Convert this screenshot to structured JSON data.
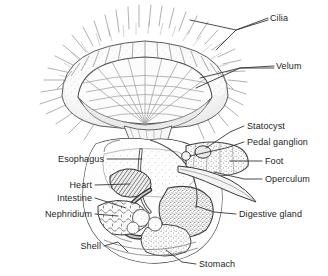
{
  "figure": {
    "kind": "biological-diagram",
    "background_color": "#ffffff",
    "ink_color": "#333333",
    "label_color": "#1d1d1d"
  },
  "labels": {
    "cilia": "Cilia",
    "velum": "Velum",
    "statocyst": "Statocyst",
    "pedal_ganglion": "Pedal ganglion",
    "foot": "Foot",
    "operculum": "Operculum",
    "digestive_gland": "Digestive gland",
    "stomach": "Stomach",
    "esophagus": "Esophagus",
    "heart": "Heart",
    "intestine": "Intestine",
    "nephridium": "Nephridium",
    "shell": "Shell"
  },
  "label_positions": {
    "cilia": {
      "x": 270,
      "y": 14,
      "side": "right"
    },
    "velum": {
      "x": 276,
      "y": 63,
      "side": "right"
    },
    "statocyst": {
      "x": 247,
      "y": 124,
      "side": "right"
    },
    "pedal_ganglion": {
      "x": 247,
      "y": 140,
      "side": "right"
    },
    "foot": {
      "x": 264,
      "y": 159,
      "side": "right"
    },
    "operculum": {
      "x": 264,
      "y": 177,
      "side": "right"
    },
    "digestive_gland": {
      "x": 238,
      "y": 212,
      "side": "right"
    },
    "stomach": {
      "x": 198,
      "y": 262,
      "side": "right"
    },
    "esophagus": {
      "x": 71,
      "y": 157,
      "side": "left"
    },
    "heart": {
      "x": 71,
      "y": 183,
      "side": "left"
    },
    "intestine": {
      "x": 71,
      "y": 196,
      "side": "left"
    },
    "nephridium": {
      "x": 71,
      "y": 212,
      "side": "left"
    },
    "shell": {
      "x": 78,
      "y": 244,
      "side": "left"
    }
  },
  "leader_lines": {
    "cilia": "forked, two tips on the ciliary fringe",
    "velum": "forked, two tips on the velar rim",
    "statocyst": "single diagonal to small oval body",
    "pedal_ganglion": "single diagonal to ganglion",
    "foot": "horizontal to stippled foot mass",
    "operculum": "diagonal to curved operculum blade",
    "digestive_gland": "long diagonal into stippled gland",
    "stomach": "diagonal up-left into stomach",
    "esophagus": "horizontal to esophageal tube",
    "heart": "horizontal to hatched heart band",
    "intestine": "horizontal to coiled intestine",
    "nephridium": "horizontal to cellular nephridium",
    "shell": "diagonal up-right to shell wall"
  }
}
